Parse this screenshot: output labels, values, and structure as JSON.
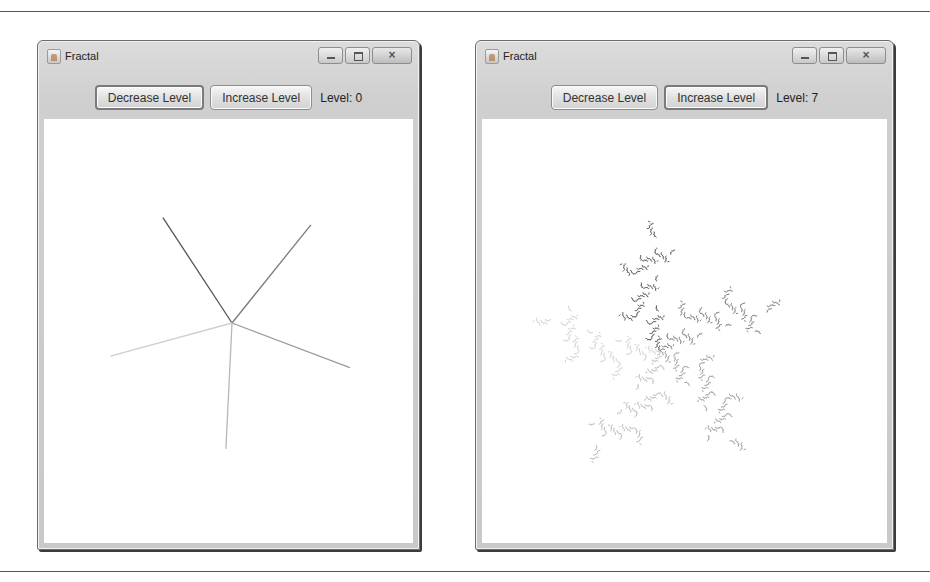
{
  "windows": [
    {
      "id": "left",
      "title": "Fractal",
      "buttons": {
        "decrease": "Decrease Level",
        "increase": "Increase Level"
      },
      "level_label": "Level: 0",
      "level": 0,
      "focused_button": "decrease",
      "controls": {
        "minimize": "minimize",
        "maximize": "maximize",
        "close": "×"
      }
    },
    {
      "id": "right",
      "title": "Fractal",
      "buttons": {
        "decrease": "Decrease Level",
        "increase": "Increase Level"
      },
      "level_label": "Level: 7",
      "level": 7,
      "focused_button": "increase",
      "controls": {
        "minimize": "minimize",
        "maximize": "maximize",
        "close": "×"
      }
    }
  ],
  "fractal": {
    "branches": 5,
    "stroke_shades": [
      "#555555",
      "#7a7a7a",
      "#9a9a9a",
      "#b8b8b8",
      "#cfcfcf"
    ]
  }
}
